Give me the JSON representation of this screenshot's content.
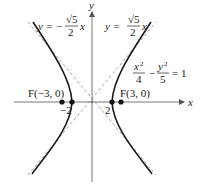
{
  "figure": {
    "axes": {
      "x_label": "x",
      "y_label": "y"
    },
    "equation": {
      "lhs_num1": "x",
      "lhs_num1_exp": "2",
      "lhs_den1": "4",
      "minus": "−",
      "lhs_num2": "y",
      "lhs_num2_exp": "2",
      "lhs_den2": "5",
      "rhs": "= 1"
    },
    "asymptote_left": {
      "prefix": "y = −",
      "num": "√5",
      "den": "2",
      "suffix": "x"
    },
    "asymptote_right": {
      "prefix": "y =",
      "num": "√5",
      "den": "2",
      "suffix": "x"
    },
    "points": {
      "focus_left": "F(−3, 0)",
      "focus_right": "F(3, 0)",
      "vertex_left": "−2",
      "vertex_right": "2"
    },
    "colors": {
      "curve": "#1a1a1a",
      "asymptote": "#888888",
      "axis": "#777777"
    }
  }
}
